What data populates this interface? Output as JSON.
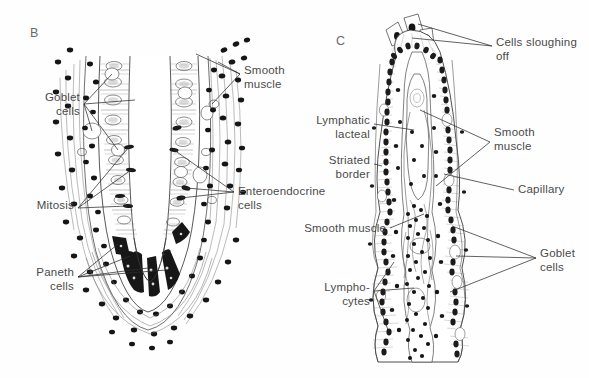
{
  "figure": {
    "type": "histology-diagram",
    "background_color": "#fefefe",
    "ink_color": "#2e2e2e",
    "label_color": "#4a4a4a"
  },
  "panels": [
    {
      "id": "B",
      "letter": "B",
      "title": "Intestinal crypt (crypt of Lieberkuhn)",
      "labels": [
        {
          "name": "goblet-cells",
          "text": "Goblet\ncells",
          "align": "right",
          "x": 18,
          "y": 91,
          "width": 62
        },
        {
          "name": "smooth-muscle",
          "text": "Smooth\nmuscle",
          "align": "left",
          "x": 244,
          "y": 64,
          "width": 70
        },
        {
          "name": "enteroendocrine-cells",
          "text": "Enteroendocrine\ncells",
          "align": "left",
          "x": 238,
          "y": 185,
          "width": 92
        },
        {
          "name": "mitosis",
          "text": "Mitosis",
          "align": "right",
          "x": 14,
          "y": 199,
          "width": 60
        },
        {
          "name": "paneth-cells",
          "text": "Paneth\ncells",
          "align": "right",
          "x": 14,
          "y": 266,
          "width": 60
        }
      ]
    },
    {
      "id": "C",
      "letter": "C",
      "title": "Intestinal villus",
      "labels": [
        {
          "name": "cells-sloughing-off",
          "text": "Cells sloughing\noff",
          "align": "left",
          "x": 496,
          "y": 36,
          "width": 92
        },
        {
          "name": "lymphatic-lacteal",
          "text": "Lymphatic\nlacteal",
          "align": "right",
          "x": 302,
          "y": 114,
          "width": 68
        },
        {
          "name": "smooth-muscle-right",
          "text": "Smooth\nmuscle",
          "align": "left",
          "x": 494,
          "y": 126,
          "width": 70
        },
        {
          "name": "striated-border",
          "text": "Striated\nborder",
          "align": "right",
          "x": 302,
          "y": 154,
          "width": 68
        },
        {
          "name": "capillary",
          "text": "Capillary",
          "align": "left",
          "x": 518,
          "y": 183,
          "width": 70
        },
        {
          "name": "smooth-muscle-left",
          "text": "Smooth muscle",
          "align": "right",
          "x": 296,
          "y": 223,
          "width": 90
        },
        {
          "name": "goblet-cells-right",
          "text": "Goblet\ncells",
          "align": "left",
          "x": 540,
          "y": 247,
          "width": 50
        },
        {
          "name": "lymphocytes",
          "text": "Lympho-\ncytes",
          "align": "right",
          "x": 302,
          "y": 281,
          "width": 68
        }
      ]
    }
  ],
  "structures": {
    "crypt": [
      "epithelium",
      "lumen",
      "lamina-propria",
      "paneth-cell-zone",
      "mitotic-figures"
    ],
    "villus": [
      "surface-epithelium",
      "striated-border",
      "lacteal",
      "capillary",
      "lamina-propria",
      "goblet-cells",
      "lymphocyte-clusters"
    ]
  }
}
